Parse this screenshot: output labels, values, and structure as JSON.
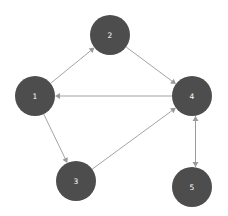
{
  "graph": {
    "type": "directed-graph",
    "width": 228,
    "height": 216,
    "background_color": "#ffffff",
    "node_color": "#4d4d4d",
    "node_label_color": "#ffffff",
    "edge_color": "#999999",
    "arrow_color": "#999999",
    "node_radius": 20,
    "nodes": [
      {
        "id": "1",
        "label": "1",
        "x": 35,
        "y": 96
      },
      {
        "id": "2",
        "label": "2",
        "x": 110,
        "y": 35
      },
      {
        "id": "3",
        "label": "3",
        "x": 76,
        "y": 181
      },
      {
        "id": "4",
        "label": "4",
        "x": 192,
        "y": 96
      },
      {
        "id": "5",
        "label": "5",
        "x": 192,
        "y": 187
      }
    ],
    "edges": [
      {
        "from": "1",
        "to": "2",
        "directed": true,
        "offset": 0
      },
      {
        "from": "2",
        "to": "4",
        "directed": true,
        "offset": 0
      },
      {
        "from": "4",
        "to": "1",
        "directed": true,
        "offset": 0
      },
      {
        "from": "1",
        "to": "3",
        "directed": true,
        "offset": 0
      },
      {
        "from": "3",
        "to": "4",
        "directed": true,
        "offset": 0
      },
      {
        "from": "4",
        "to": "5",
        "directed": true,
        "offset": -3.5
      },
      {
        "from": "5",
        "to": "4",
        "directed": true,
        "offset": 3.5
      }
    ]
  }
}
